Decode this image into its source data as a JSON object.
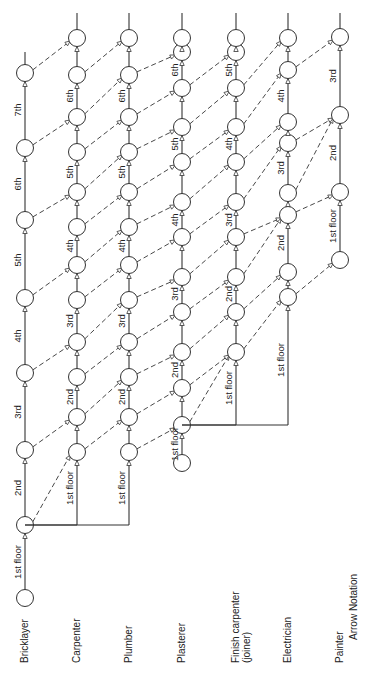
{
  "title": "Arrow Notation",
  "orientation": "rotated-90-ccw",
  "trades": [
    {
      "name": "Bricklayer",
      "x": 25
    },
    {
      "name": "Carpenter",
      "x": 77
    },
    {
      "name": "Plumber",
      "x": 129
    },
    {
      "name": "Plasterer",
      "x": 182
    },
    {
      "name": "Finish carpenter",
      "sub": "(joiner)",
      "x": 236
    },
    {
      "name": "Electrician",
      "x": 288
    },
    {
      "name": "Painter",
      "x": 340
    }
  ],
  "columns": [
    {
      "trade": "Bricklayer",
      "x": 25,
      "nodes": [
        598,
        525,
        450,
        373,
        298,
        220,
        148,
        73
      ],
      "top": 52,
      "labels": [
        {
          "text": "1st floor",
          "y": 562
        },
        {
          "text": "2nd",
          "y": 488
        },
        {
          "text": "3rd",
          "y": 412
        },
        {
          "text": "4th",
          "y": 336
        },
        {
          "text": "5th",
          "y": 260
        },
        {
          "text": "6th",
          "y": 184
        },
        {
          "text": "7th",
          "y": 110
        }
      ]
    },
    {
      "trade": "Carpenter",
      "x": 77,
      "start_y": 525,
      "nodes": [
        452,
        417,
        377,
        342,
        300,
        265,
        227,
        192,
        152,
        117,
        75,
        38
      ],
      "top": 13,
      "labels": [
        {
          "text": "1st floor",
          "y": 488
        },
        {
          "text": "2nd",
          "y": 397
        },
        {
          "text": "3rd",
          "y": 321
        },
        {
          "text": "4th",
          "y": 246
        },
        {
          "text": "5th",
          "y": 172
        },
        {
          "text": "6th",
          "y": 96
        }
      ]
    },
    {
      "trade": "Plumber",
      "x": 129,
      "start_y": 525,
      "nodes": [
        452,
        417,
        377,
        342,
        300,
        265,
        227,
        192,
        152,
        117,
        75,
        38
      ],
      "top": 13,
      "labels": [
        {
          "text": "1st floor",
          "y": 488
        },
        {
          "text": "2nd",
          "y": 397
        },
        {
          "text": "3rd",
          "y": 321
        },
        {
          "text": "4th",
          "y": 246
        },
        {
          "text": "5th",
          "y": 172
        },
        {
          "text": "6th",
          "y": 96
        }
      ]
    },
    {
      "trade": "Plasterer",
      "x": 182,
      "nodes": [
        463,
        425,
        388,
        352,
        312,
        277,
        237,
        202,
        162,
        127,
        88,
        52,
        38
      ],
      "top": 13,
      "labels": [
        {
          "text": "1st floor",
          "y": 444
        },
        {
          "text": "2nd",
          "y": 370
        },
        {
          "text": "3rd",
          "y": 294
        },
        {
          "text": "4th",
          "y": 220
        },
        {
          "text": "5th",
          "y": 144
        },
        {
          "text": "6th",
          "y": 70
        }
      ]
    },
    {
      "trade": "Finish carpenter (joiner)",
      "x": 236,
      "start_y": 425,
      "nodes": [
        352,
        312,
        277,
        237,
        202,
        162,
        127,
        88,
        52,
        38
      ],
      "top": 13,
      "labels": [
        {
          "text": "1st floor",
          "y": 388
        },
        {
          "text": "2nd",
          "y": 294
        },
        {
          "text": "3rd",
          "y": 220
        },
        {
          "text": "4th",
          "y": 144
        },
        {
          "text": "5th",
          "y": 70
        }
      ]
    },
    {
      "trade": "Electrician",
      "x": 288,
      "start_y": 425,
      "nodes": [
        297,
        272,
        215,
        193,
        143,
        122,
        70,
        38
      ],
      "top": 13,
      "labels": [
        {
          "text": "1st floor",
          "y": 360
        },
        {
          "text": "2nd",
          "y": 243
        },
        {
          "text": "3rd",
          "y": 168
        },
        {
          "text": "4th",
          "y": 96
        }
      ]
    },
    {
      "trade": "Painter",
      "x": 340,
      "nodes": [
        260,
        192,
        115,
        37
      ],
      "top": 13,
      "labels": [
        {
          "text": "1st floor",
          "y": 226
        },
        {
          "text": "2nd",
          "y": 153
        },
        {
          "text": "3rd",
          "y": 76
        }
      ]
    }
  ],
  "caption": {
    "text": "Arrow Notation",
    "x": 357,
    "y": 640
  }
}
